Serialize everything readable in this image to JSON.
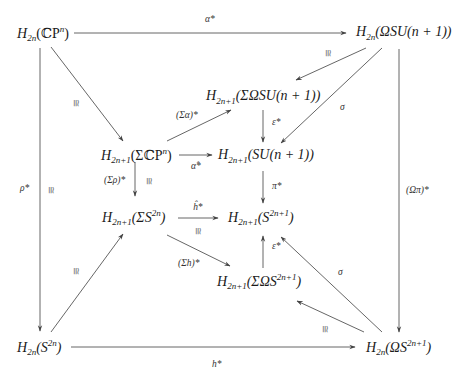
{
  "diagram": {
    "type": "commutative-diagram",
    "nodes": {
      "tl": {
        "base": "H",
        "sub": "2n",
        "arg_pre": "(ℂP",
        "sup": "n",
        "arg_post": ")"
      },
      "tr": {
        "base": "H",
        "sub": "2n",
        "arg_pre": "(ΩSU(n + 1))",
        "sup": "",
        "arg_post": ""
      },
      "sigma_omega_su": {
        "base": "H",
        "sub": "2n+1",
        "arg_pre": "(ΣΩSU(n + 1))",
        "sup": "",
        "arg_post": ""
      },
      "sigma_cp": {
        "base": "H",
        "sub": "2n+1",
        "arg_pre": "(ΣℂP",
        "sup": "n",
        "arg_post": ")"
      },
      "su": {
        "base": "H",
        "sub": "2n+1",
        "arg_pre": "(SU(n + 1))",
        "sup": "",
        "arg_post": ""
      },
      "sigma_s2n": {
        "base": "H",
        "sub": "2n+1",
        "arg_pre": "(ΣS",
        "sup": "2n",
        "arg_post": ")"
      },
      "s2n1": {
        "base": "H",
        "sub": "2n+1",
        "arg_pre": "(S",
        "sup": "2n+1",
        "arg_post": ")"
      },
      "sigma_omega_s": {
        "base": "H",
        "sub": "2n+1",
        "arg_pre": "(ΣΩS",
        "sup": "2n+1",
        "arg_post": ")"
      },
      "bl": {
        "base": "H",
        "sub": "2n",
        "arg_pre": "(S",
        "sup": "2n",
        "arg_post": ")"
      },
      "br": {
        "base": "H",
        "sub": "2n",
        "arg_pre": "(ΩS",
        "sup": "2n+1",
        "arg_post": ")"
      }
    },
    "arrows": [
      {
        "from": "tl",
        "to": "tr",
        "label": "α*"
      },
      {
        "from": "tl",
        "to": "bl",
        "label": "ρ*",
        "iso": "≅"
      },
      {
        "from": "tl",
        "to": "sigma_cp",
        "label": "",
        "iso": "≅"
      },
      {
        "from": "tr",
        "to": "sigma_omega_su",
        "label": "",
        "iso": "≅"
      },
      {
        "from": "tr",
        "to": "su",
        "label": "σ"
      },
      {
        "from": "tr",
        "to": "br",
        "label": "(Ωπ)*"
      },
      {
        "from": "sigma_cp",
        "to": "sigma_omega_su",
        "label": "(Σα)*"
      },
      {
        "from": "sigma_cp",
        "to": "su",
        "label": "α̂*"
      },
      {
        "from": "sigma_cp",
        "to": "sigma_s2n",
        "label": "(Σρ)*",
        "iso": "≅"
      },
      {
        "from": "sigma_omega_su",
        "to": "su",
        "label": "ε*"
      },
      {
        "from": "su",
        "to": "s2n1",
        "label": "π*"
      },
      {
        "from": "sigma_s2n",
        "to": "s2n1",
        "label": "ĥ*",
        "iso": "≅"
      },
      {
        "from": "sigma_s2n",
        "to": "sigma_omega_s",
        "label": "(Σh)*"
      },
      {
        "from": "sigma_omega_s",
        "to": "s2n1",
        "label": "ε*"
      },
      {
        "from": "bl",
        "to": "sigma_s2n",
        "label": "",
        "iso": "≅"
      },
      {
        "from": "bl",
        "to": "br",
        "label": "h*"
      },
      {
        "from": "br",
        "to": "s2n1",
        "label": "σ"
      },
      {
        "from": "br",
        "to": "sigma_omega_s",
        "label": "",
        "iso": "≅"
      }
    ],
    "labels": {
      "alpha_star": "α*",
      "rho_star": "ρ*",
      "sigma_alpha_star": "(Σα)*",
      "alpha_hat_star": "α̂*",
      "sigma_rho_star": "(Σρ)*",
      "epsilon_star": "ε*",
      "pi_star": "π*",
      "h_hat_star": "ĥ*",
      "sigma_h_star": "(Σh)*",
      "h_star": "h*",
      "sigma": "σ",
      "omega_pi_star": "(Ωπ)*",
      "iso": "≅"
    }
  }
}
